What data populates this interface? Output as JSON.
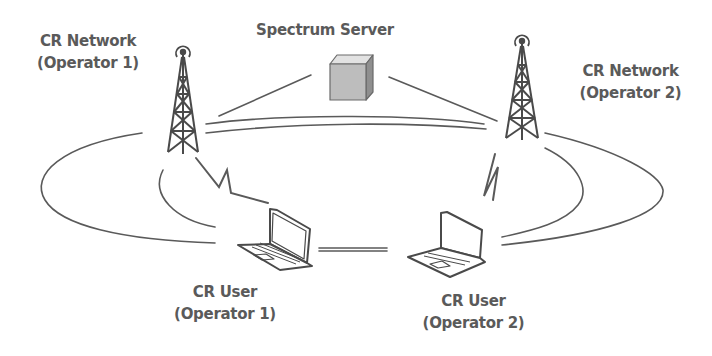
{
  "colors": {
    "stroke": "#5a5a5a",
    "text": "#5a5a5a",
    "cube_front": "#bdbdbd",
    "cube_top": "#e2e2e2",
    "cube_side": "#8f8f8f",
    "background": "#ffffff"
  },
  "nodes": {
    "server": {
      "label": "Spectrum Server",
      "icon": "server-cube-icon"
    },
    "network1": {
      "line1": "CR Network",
      "line2": "(Operator 1)",
      "icon": "cell-tower-icon"
    },
    "network2": {
      "line1": "CR Network",
      "line2": "(Operator 2)",
      "icon": "cell-tower-icon"
    },
    "user1": {
      "line1": "CR User",
      "line2": "(Operator 1)",
      "icon": "laptop-icon"
    },
    "user2": {
      "line1": "CR User",
      "line2": "(Operator 2)",
      "icon": "laptop-icon"
    }
  },
  "links": [
    {
      "from": "server",
      "to": "network1",
      "type": "wired"
    },
    {
      "from": "server",
      "to": "network2",
      "type": "wired"
    },
    {
      "from": "network1",
      "to": "network2",
      "type": "double-line"
    },
    {
      "from": "network1",
      "to": "user1",
      "type": "wireless-zigzag"
    },
    {
      "from": "network2",
      "to": "user2",
      "type": "wireless-zigzag"
    },
    {
      "from": "user1",
      "to": "user2",
      "type": "double-line"
    }
  ],
  "coverage": [
    {
      "name": "operator1-coverage",
      "shape": "ellipse-arc"
    },
    {
      "name": "operator2-coverage",
      "shape": "ellipse-arc"
    }
  ]
}
